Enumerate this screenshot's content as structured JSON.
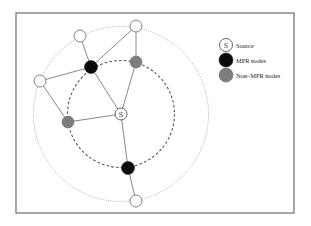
{
  "diagram": {
    "type": "network-topology",
    "frame": {
      "x": 16,
      "y": 13,
      "width": 278,
      "height": 200
    },
    "source": {
      "id": "S",
      "label": "S",
      "x": 121,
      "y": 114
    },
    "rings": {
      "outer": {
        "style": "dotted",
        "cx": 121,
        "cy": 114,
        "r": 87.5
      },
      "inner": {
        "style": "dashed",
        "cx": 121,
        "cy": 114,
        "r": 53.5
      }
    },
    "nodes": [
      {
        "id": "w1",
        "kind": "plain",
        "x": 80,
        "y": 36
      },
      {
        "id": "w2",
        "kind": "plain",
        "x": 136,
        "y": 26
      },
      {
        "id": "w3",
        "kind": "plain",
        "x": 40,
        "y": 81
      },
      {
        "id": "w4",
        "kind": "plain",
        "x": 136,
        "y": 201
      },
      {
        "id": "m1",
        "kind": "mpr",
        "x": 91,
        "y": 67
      },
      {
        "id": "m2",
        "kind": "mpr",
        "x": 128,
        "y": 168
      },
      {
        "id": "g1",
        "kind": "non-mpr",
        "x": 136,
        "y": 62
      },
      {
        "id": "g2",
        "kind": "non-mpr",
        "x": 68,
        "y": 122
      }
    ],
    "edges": [
      [
        "m1",
        "w1"
      ],
      [
        "m1",
        "w2"
      ],
      [
        "m1",
        "w3"
      ],
      [
        "m1",
        "S"
      ],
      [
        "w2",
        "g1"
      ],
      [
        "g1",
        "S"
      ],
      [
        "w3",
        "g2"
      ],
      [
        "g2",
        "S"
      ],
      [
        "S",
        "m2"
      ],
      [
        "m2",
        "w4"
      ]
    ]
  },
  "legend": {
    "items": [
      {
        "kind": "source",
        "symbol": "S",
        "label": "Source"
      },
      {
        "kind": "mpr",
        "label": "MPR nodes"
      },
      {
        "kind": "non-mpr",
        "label": "Non–MPR nodes"
      }
    ]
  },
  "colors": {
    "mpr": "#0a0a0a",
    "non_mpr": "#7d7d7d",
    "plain": "#ffffff",
    "edge": "#7a7a7a",
    "frame": "#6b6b6b"
  }
}
